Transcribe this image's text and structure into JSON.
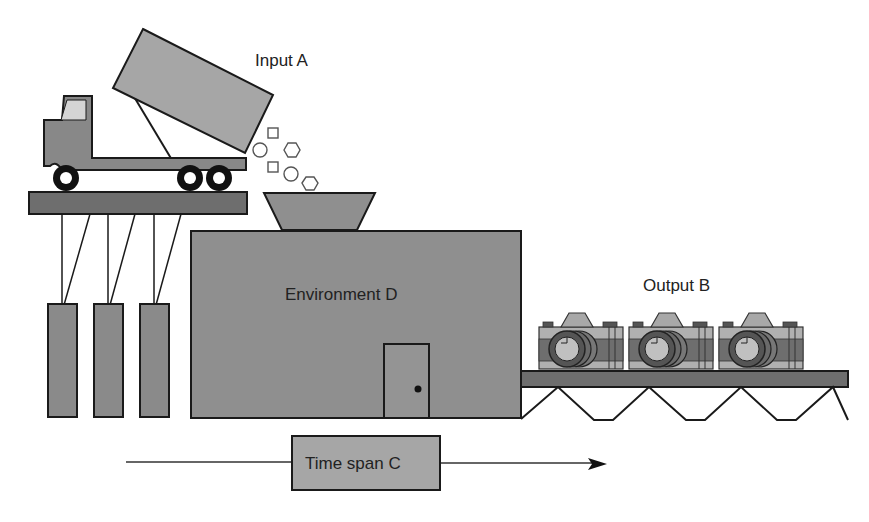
{
  "diagram": {
    "labels": {
      "input": "Input A",
      "output": "Output B",
      "time_span": "Time span C",
      "environment": "Environment D"
    },
    "elements": {
      "truck": "dump-truck",
      "input_particles": [
        "square",
        "circle",
        "hexagon",
        "square",
        "circle",
        "hexagon"
      ],
      "hopper": "funnel-hopper",
      "environment_box": "factory-building-with-door",
      "weights": 3,
      "output_items": [
        "camera",
        "camera",
        "camera"
      ],
      "conveyor": "conveyor-belt",
      "time_arrow": "left-to-right-arrow"
    },
    "colors": {
      "background": "#ffffff",
      "medium_gray": "#999999",
      "dark_gray": "#6e6e6e",
      "light_gray": "#c8c8c8",
      "outline": "#1a1a1a"
    }
  }
}
